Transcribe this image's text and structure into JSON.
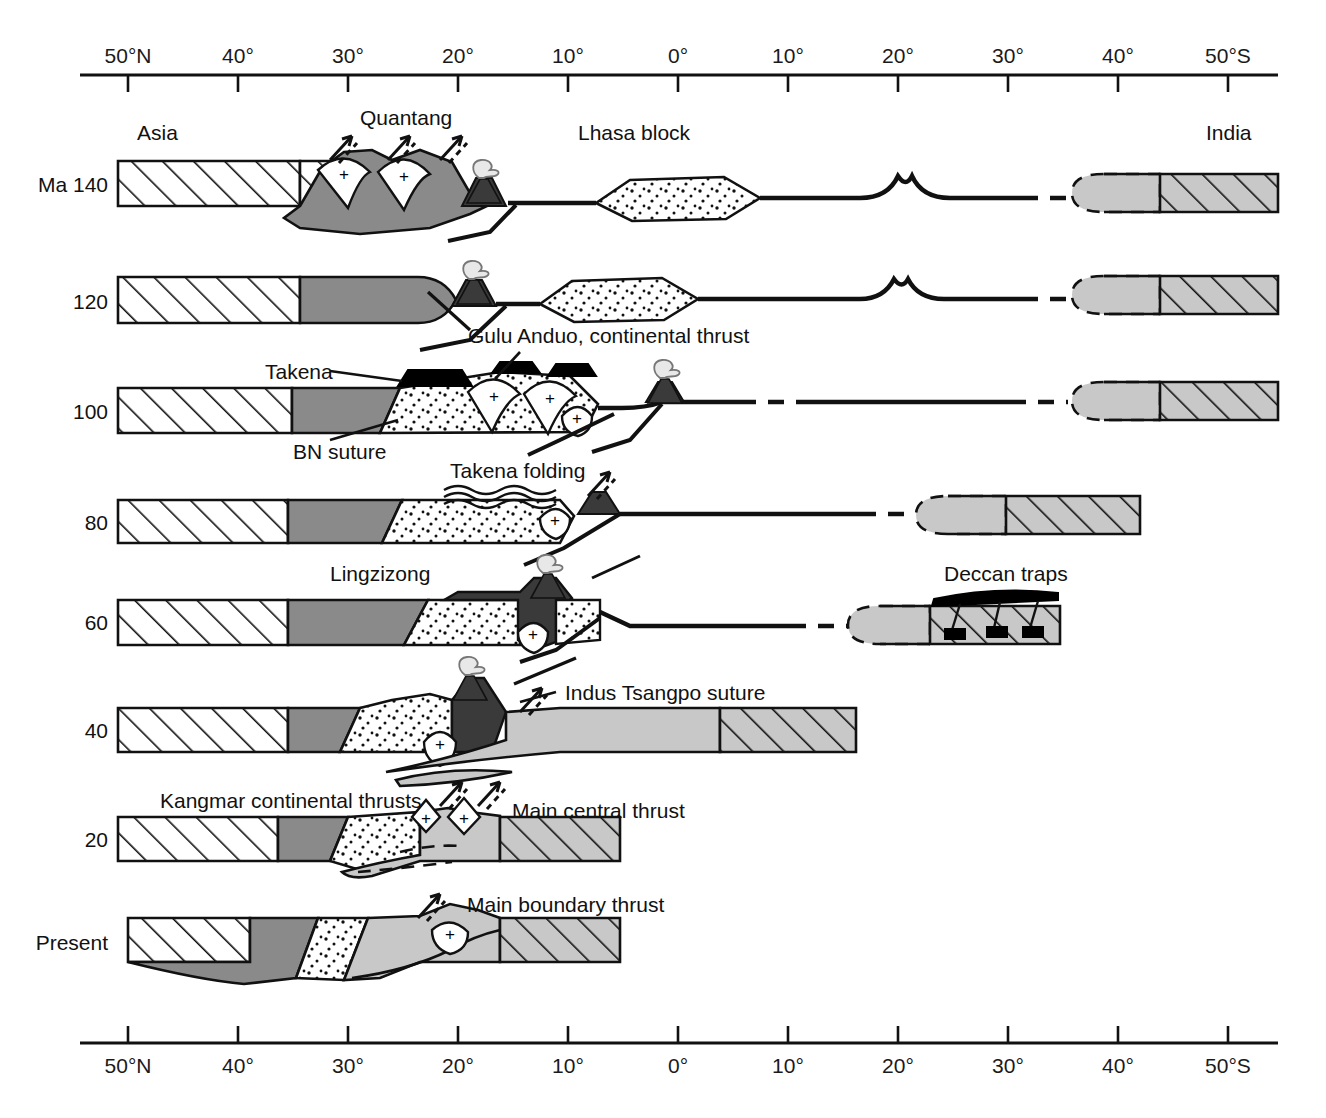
{
  "figure": {
    "type": "geological-cross-section-time-series"
  },
  "axes": {
    "top": {
      "name": "latitude-axis-top",
      "ticks": [
        {
          "label": "50°N",
          "x": 128
        },
        {
          "label": "40°",
          "x": 238
        },
        {
          "label": "30°",
          "x": 348
        },
        {
          "label": "20°",
          "x": 458
        },
        {
          "label": "10°",
          "x": 568
        },
        {
          "label": "0°",
          "x": 678
        },
        {
          "label": "10°",
          "x": 788
        },
        {
          "label": "20°",
          "x": 898
        },
        {
          "label": "30°",
          "x": 1008
        },
        {
          "label": "40°",
          "x": 1118
        },
        {
          "label": "50°S",
          "x": 1228
        }
      ],
      "line_y": 75,
      "x_start": 80,
      "x_end": 1278
    },
    "bottom": {
      "name": "latitude-axis-bottom",
      "ticks": [
        {
          "label": "50°N",
          "x": 128
        },
        {
          "label": "40°",
          "x": 238
        },
        {
          "label": "30°",
          "x": 348
        },
        {
          "label": "20°",
          "x": 458
        },
        {
          "label": "10°",
          "x": 568
        },
        {
          "label": "0°",
          "x": 678
        },
        {
          "label": "10°",
          "x": 788
        },
        {
          "label": "20°",
          "x": 898
        },
        {
          "label": "30°",
          "x": 1008
        },
        {
          "label": "40°",
          "x": 1118
        },
        {
          "label": "50°S",
          "x": 1228
        }
      ],
      "line_y": 1043,
      "x_start": 80,
      "x_end": 1278
    }
  },
  "rows": [
    {
      "id": "r140",
      "time_label": "Ma 140",
      "baseline_y": 183
    },
    {
      "id": "r120",
      "time_label": "120",
      "baseline_y": 300
    },
    {
      "id": "r100",
      "time_label": "100",
      "baseline_y": 410
    },
    {
      "id": "r80",
      "time_label": "80",
      "baseline_y": 521
    },
    {
      "id": "r60",
      "time_label": "60",
      "baseline_y": 621
    },
    {
      "id": "r40",
      "time_label": "40",
      "baseline_y": 729
    },
    {
      "id": "r20",
      "time_label": "20",
      "baseline_y": 838
    },
    {
      "id": "rpr",
      "time_label": "Present",
      "baseline_y": 941
    }
  ],
  "annotations": [
    {
      "id": "asia",
      "text": "Asia",
      "x": 137,
      "y": 140
    },
    {
      "id": "quantang",
      "text": "Quantang",
      "x": 360,
      "y": 125
    },
    {
      "id": "lhasa",
      "text": "Lhasa block",
      "x": 578,
      "y": 140
    },
    {
      "id": "india",
      "text": "India",
      "x": 1206,
      "y": 140
    },
    {
      "id": "gulu-anduo",
      "text": "Gulu Anduo, continental thrust",
      "x": 468,
      "y": 343
    },
    {
      "id": "takena",
      "text": "Takena",
      "x": 265,
      "y": 373
    },
    {
      "id": "bn-suture",
      "text": "BN suture",
      "x": 293,
      "y": 452
    },
    {
      "id": "takena-fold",
      "text": "Takena folding",
      "x": 450,
      "y": 478
    },
    {
      "id": "lingzizong",
      "text": "Lingzizong",
      "x": 330,
      "y": 573
    },
    {
      "id": "deccan",
      "text": "Deccan traps",
      "x": 944,
      "y": 573
    },
    {
      "id": "indus",
      "text": "Indus Tsangpo suture",
      "x": 525,
      "y": 696
    },
    {
      "id": "kangmar",
      "text": "Kangmar continental thrusts",
      "x": 160,
      "y": 801
    },
    {
      "id": "mct",
      "text": "Main central thrust",
      "x": 487,
      "y": 814
    },
    {
      "id": "mbt",
      "text": "Main boundary thrust",
      "x": 467,
      "y": 905
    }
  ],
  "legend_units": [
    {
      "key": "asia-crust",
      "name": "Asia continental crust",
      "fill": "hatch-45",
      "color": "#ffffff"
    },
    {
      "key": "qiangtang",
      "name": "Qiangtang terrane",
      "fill": "solid",
      "color": "#8a8a8a"
    },
    {
      "key": "lhasa",
      "name": "Lhasa block",
      "fill": "stipple",
      "color": "#ffffff"
    },
    {
      "key": "india-crust",
      "name": "India continental crust",
      "fill": "hatch-45",
      "color": "#c8c8c8"
    },
    {
      "key": "india-margin",
      "name": "India margin / shelf",
      "fill": "solid",
      "color": "#c8c8c8"
    },
    {
      "key": "arc",
      "name": "Magmatic arc",
      "fill": "solid",
      "color": "#3a3a3a"
    },
    {
      "key": "takena",
      "name": "Takena formation",
      "fill": "solid",
      "color": "#000000"
    },
    {
      "key": "granite",
      "name": "Granite pluton",
      "fill": "solid",
      "color": "#ffffff",
      "symbol": "+"
    }
  ],
  "symbols": {
    "granite_plus": "+",
    "volcano": "volcano-with-plume",
    "thrust_arrow": "arrow-with-dashed-companion"
  }
}
